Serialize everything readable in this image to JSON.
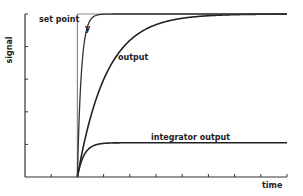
{
  "chart_data": {
    "type": "line",
    "title": "",
    "xlabel": "time",
    "ylabel": "signal",
    "xlim": [
      0,
      10
    ],
    "ylim": [
      0,
      5
    ],
    "x_ticks": [
      1,
      2,
      3,
      4,
      5,
      6,
      7,
      8,
      9,
      10
    ],
    "y_ticks": [
      1,
      2,
      3,
      4,
      5
    ],
    "tick_labels_shown": false,
    "grid": false,
    "step_time": 2,
    "series": [
      {
        "name": "set point",
        "kind": "step",
        "value": 5,
        "color": "#888888"
      },
      {
        "name": "y",
        "kind": "first-order",
        "final": 5,
        "time_constant": 0.15,
        "color": "#333333"
      },
      {
        "name": "output",
        "kind": "first-order",
        "final": 5,
        "time_constant": 1.1,
        "color": "#222222"
      },
      {
        "name": "integrator output",
        "kind": "first-order",
        "final": 1.05,
        "time_constant": 0.25,
        "color": "#222222"
      }
    ],
    "annotations": [
      {
        "text": "set point",
        "near": "top-left of step"
      },
      {
        "text": "y",
        "near": "fast curve"
      },
      {
        "text": "output",
        "near": "slow curve"
      },
      {
        "text": "integrator output",
        "near": "lower plateau"
      }
    ]
  }
}
